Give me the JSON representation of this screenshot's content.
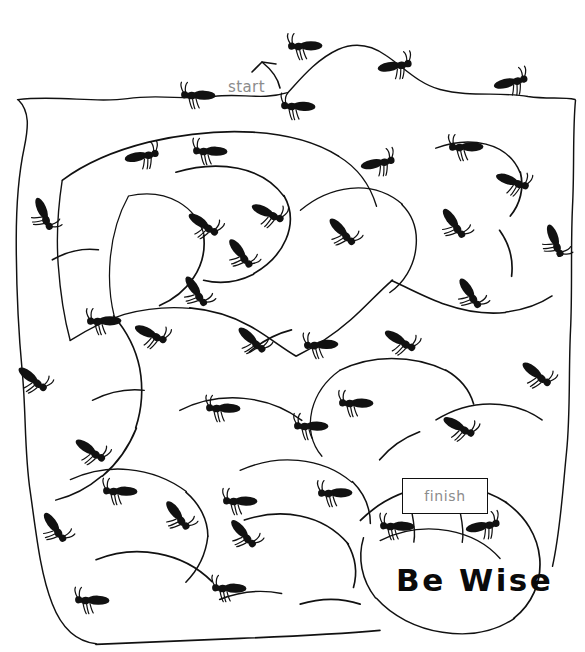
{
  "page": {
    "kind": "printable-maze-worksheet",
    "theme": "ants",
    "background_color": "#ffffff",
    "ink_color": "#111111",
    "label_color": "#8c8c8c",
    "width": 585,
    "height": 652
  },
  "labels": {
    "start": "start",
    "finish": "finish",
    "motto": "Be Wise",
    "header_faint": ""
  },
  "finish_sign": {
    "x": 402,
    "y": 478,
    "w": 84,
    "h": 34,
    "border_color": "#111111",
    "fill": "#ffffff"
  },
  "start_marker": {
    "x": 240,
    "y": 85,
    "arrow": "curved-arrow-down-left"
  },
  "motto_position": {
    "x": 396,
    "y": 562
  },
  "icons": {
    "ant": "ant-icon",
    "arrow": "curved-arrow-icon"
  },
  "counts": {
    "ants": 41
  },
  "maze_walls": [
    "M 18,100 C 60,95 95,104 128,99 C 160,94 186,101 214,97 C 240,93 262,101 288,93",
    "M 288,93 C 300,80 316,60 338,50 C 356,42 372,46 386,56 C 404,68 418,84 440,90 C 470,98 500,92 528,97 C 548,100 562,97 575,100",
    "M 18,100 C 30,112 28,128 24,148 C 18,176 16,208 16,240 C 16,282 18,330 22,372 C 26,414 24,452 30,492 C 36,534 40,574 52,604 C 62,630 78,642 96,644",
    "M 575,100 C 572,130 574,168 572,206 C 570,248 572,290 570,330 C 568,372 570,414 566,452 C 562,492 560,530 552,566",
    "M 96,644 C 140,642 190,640 240,638 C 290,636 336,634 380,630",
    "M 62,180 C 86,162 116,150 148,142 C 182,134 218,130 252,132 C 286,134 316,142 338,156",
    "M 338,156 C 358,168 370,186 376,206",
    "M 62,180 C 58,206 56,236 58,264 C 60,292 64,318 70,340",
    "M 70,340 C 86,330 104,320 124,314 C 146,308 168,306 190,308",
    "M 190,308 C 212,310 232,316 250,326 C 268,336 282,348 296,356",
    "M 296,356 C 316,346 334,334 350,320 C 366,306 378,292 392,280",
    "M 392,280 C 410,288 428,298 446,304 C 466,311 486,314 506,312",
    "M 506,312 C 524,310 540,304 552,296",
    "M 128,196 C 118,214 112,236 110,258 C 108,280 110,300 114,316",
    "M 128,196 C 146,192 164,194 178,202 C 192,210 200,222 204,236",
    "M 204,236 C 206,252 202,266 194,278 C 186,290 174,300 160,306",
    "M 176,172 C 196,166 218,164 238,168 C 258,172 274,182 284,196",
    "M 284,196 C 292,210 292,226 286,240 C 280,254 268,266 254,274",
    "M 254,274 C 238,282 220,284 204,280",
    "M 300,210 C 314,198 332,190 350,188 C 370,186 388,192 402,204",
    "M 402,204 C 414,216 418,232 416,248 C 414,266 404,282 390,292",
    "M 436,148 C 452,142 470,140 486,144 C 502,148 514,158 520,172",
    "M 520,172 C 524,188 520,204 510,216",
    "M 340,370 C 356,362 374,358 392,358 C 412,358 430,362 446,370",
    "M 446,370 C 460,378 470,390 474,404",
    "M 340,370 C 326,380 316,394 312,410 C 308,428 312,444 322,456",
    "M 180,410 C 200,400 222,396 244,398 C 266,400 286,408 302,420",
    "M 114,316 C 126,330 136,348 140,368 C 144,390 142,410 136,428",
    "M 136,428 C 128,448 116,464 102,476",
    "M 102,476 C 88,488 72,496 56,500",
    "M 70,480 C 88,472 108,468 128,470 C 150,472 170,480 186,492",
    "M 186,492 C 200,504 208,520 208,536",
    "M 208,536 C 206,554 198,570 186,582",
    "M 96,560 C 116,552 138,550 158,554 C 180,558 198,568 212,582",
    "M 240,470 C 258,462 278,458 298,460 C 320,462 338,470 352,482",
    "M 352,482 C 364,494 370,508 370,524",
    "M 244,520 C 262,514 282,512 300,516 C 320,520 336,530 348,544",
    "M 348,544 C 356,558 358,574 354,588",
    "M 360,520 C 378,502 402,490 428,486 C 456,482 484,488 506,502",
    "M 506,502 C 526,516 538,536 540,558 C 542,582 532,604 514,618",
    "M 514,618 C 494,632 468,636 442,632 C 416,628 392,616 376,598",
    "M 376,598 C 362,580 358,558 364,538",
    "M 380,540 C 400,530 424,526 448,530 C 470,534 488,544 500,558",
    "M 412,512 C 414,522 416,532 414,542",
    "M 460,512 C 462,522 464,532 462,542",
    "M 436,420 C 452,410 470,404 490,404 C 510,404 528,410 542,420",
    "M 420,432 C 404,438 390,448 380,460",
    "M 250,352 C 262,342 276,334 292,330",
    "M 92,400 C 108,392 126,388 144,390",
    "M 52,260 C 66,252 82,248 98,250",
    "M 500,230 C 510,244 514,260 512,276",
    "M 220,600 C 240,592 262,590 282,594",
    "M 300,604 C 320,598 342,598 360,604"
  ]
}
